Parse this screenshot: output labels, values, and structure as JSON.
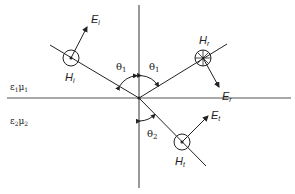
{
  "diagram": {
    "type": "oblique incidence of plane wave at dielectric interface (perpendicular polarization)",
    "media": {
      "upper": {
        "label_eps": "ε",
        "eps_sub": "1",
        "label_mu": "μ",
        "mu_sub": "1"
      },
      "lower": {
        "label_eps": "ε",
        "eps_sub": "2",
        "label_mu": "μ",
        "mu_sub": "2"
      }
    },
    "angles": {
      "incident": {
        "symbol": "θ",
        "sub": "1"
      },
      "reflected": {
        "symbol": "θ",
        "sub": "1"
      },
      "transmitted": {
        "symbol": "θ",
        "sub": "2"
      }
    },
    "waves": {
      "incident": {
        "E": "E",
        "E_sub": "i",
        "H": "H",
        "H_sub": "i",
        "H_direction": "out-of-page (dot)"
      },
      "reflected": {
        "E": "E",
        "E_sub": "r",
        "H": "H",
        "H_sub": "r",
        "H_direction": "into-page (cross)"
      },
      "transmitted": {
        "E": "E",
        "E_sub": "t",
        "H": "H",
        "H_sub": "t",
        "H_direction": "out-of-page (dot)"
      }
    },
    "colors": {
      "line": "#222222",
      "interface": "#555555",
      "background": "#ffffff"
    }
  }
}
